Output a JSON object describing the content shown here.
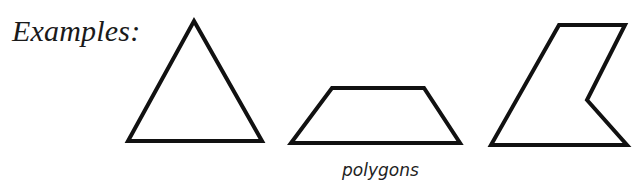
{
  "heading": "Examples:",
  "caption": "polygons",
  "colors": {
    "stroke": "#111111",
    "fill": "#ffffff",
    "text": "#1a1a1a"
  },
  "shapes": [
    {
      "name": "triangle",
      "points": "194,21 262,141 128,141"
    },
    {
      "name": "trapezoid",
      "points": "332,88 424,88 460,143 291,143"
    },
    {
      "name": "concave-pentagon",
      "points": "559,25 625,25 587,100 627,145 491,145"
    }
  ]
}
